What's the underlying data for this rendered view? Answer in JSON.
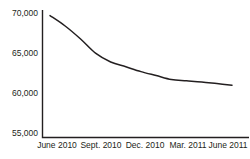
{
  "chart_data": {
    "type": "line",
    "title": "",
    "subtitle": "",
    "xlabel": "",
    "ylabel": "",
    "grid": false,
    "legend_position": "none",
    "ylim": [
      55000,
      70000
    ],
    "ytick_values": [
      70000,
      65000,
      60000,
      55000
    ],
    "ytick_labels": [
      "70,000",
      "65,000",
      "60,000",
      "55,000"
    ],
    "xtick_labels": [
      "June 2010",
      "Sept. 2010",
      "Dec. 2010",
      "Mar. 2011",
      "June 2011"
    ],
    "xtick_positions": [
      0,
      3,
      6,
      9,
      12
    ],
    "x": [
      0,
      1,
      2,
      3,
      4,
      5,
      6,
      7,
      8,
      9,
      10,
      11,
      12
    ],
    "series": [
      {
        "name": "Value",
        "color": "#231f20",
        "values": [
          69800,
          68500,
          66900,
          65100,
          64000,
          63400,
          62800,
          62300,
          61800,
          61650,
          61500,
          61300,
          61100
        ]
      }
    ],
    "annotations": []
  },
  "axes": {
    "y_axis_name": "y-axis",
    "x_axis_name": "x-axis"
  }
}
